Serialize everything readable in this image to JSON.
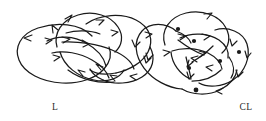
{
  "figure": {
    "background_color": "#ffffff",
    "ink_color": "#1a1a1a",
    "width": 266,
    "height": 121,
    "kind": "knot-link-diagram-pair"
  },
  "diagrams": [
    {
      "id": "left",
      "label": "L",
      "label_x": 55,
      "label_y": 110,
      "description": "oriented link diagram with three interlocked loops and directional arrowheads",
      "crossing_dots_visible": false,
      "arrowhead_count": 13,
      "loop_count": 3
    },
    {
      "id": "right",
      "label": "CL",
      "label_x": 240,
      "label_y": 110,
      "description": "oriented link diagram with marked crossing vertices shown as filled dots and an inner triangular region",
      "crossing_dots_visible": true,
      "crossing_dot_count": 6,
      "arrowhead_count": 15,
      "loop_count": 3
    }
  ],
  "labels": {
    "left_label": "L",
    "right_label": "CL"
  }
}
